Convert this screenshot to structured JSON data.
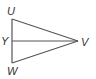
{
  "diagram": {
    "type": "triangle",
    "stroke_color": "#555555",
    "points": {
      "U": {
        "label": "U",
        "x": 12,
        "y": 19
      },
      "W": {
        "label": "W",
        "x": 12,
        "y": 63
      },
      "Y": {
        "label": "Y",
        "x": 12,
        "y": 41
      },
      "V": {
        "label": "V",
        "x": 78,
        "y": 41
      }
    },
    "segments": [
      "UV",
      "VW",
      "WU",
      "YV"
    ]
  }
}
